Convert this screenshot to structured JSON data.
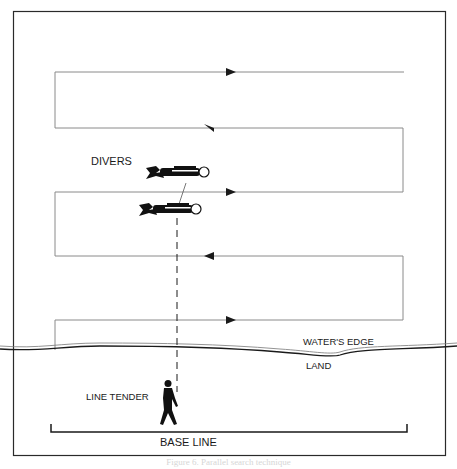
{
  "figure": {
    "labels": {
      "divers": "DIVERS",
      "waters_edge": "WATER'S EDGE",
      "land": "LAND",
      "line_tender": "LINE TENDER",
      "base_line": "BASE LINE"
    },
    "caption": "Figure 6. Parallel search technique",
    "colors": {
      "ink": "#1a1a1a",
      "search_path": "#8a8a8a",
      "frame": "#2a2a2a",
      "background": "#ffffff"
    },
    "search_path": {
      "legs": [
        {
          "y": 72,
          "direction": "right"
        },
        {
          "y": 128,
          "direction": "left"
        },
        {
          "y": 192,
          "direction": "right"
        },
        {
          "y": 256,
          "direction": "left"
        },
        {
          "y": 320,
          "direction": "right"
        }
      ]
    },
    "icons": [
      "diver-icon",
      "diver-icon",
      "person-walking-icon",
      "arrow-right-icon",
      "arrow-left-icon"
    ]
  }
}
